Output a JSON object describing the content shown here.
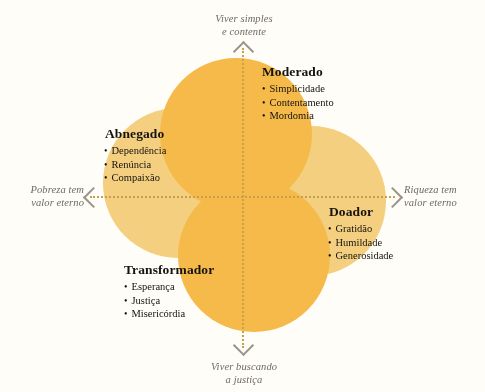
{
  "diagram": {
    "title_alt": "Diagrama de quadrantes sobre riqueza e pobreza",
    "colors": {
      "background": "#fefdf7",
      "circle_dark": "#f5ba4a",
      "circle_light": "#f9dd9a",
      "axis": "#c9a04a",
      "axis_label_text": "#6e6a61",
      "body_text": "#16130f"
    }
  },
  "axes": {
    "top": {
      "line1": "Viver simples",
      "line2": "e contente",
      "arrow": "arrow-up-icon"
    },
    "bottom": {
      "line1": "Viver buscando",
      "line2": "a justiça",
      "arrow": "arrow-down-icon"
    },
    "left": {
      "line1": "Pobreza tem",
      "line2": "valor eterno",
      "arrow": "arrow-left-icon"
    },
    "right": {
      "line1": "Riqueza tem",
      "line2": "valor eterno",
      "arrow": "arrow-right-icon"
    }
  },
  "quadrants": [
    {
      "id": "moderado",
      "title": "Moderado",
      "items": [
        "Simplicidade",
        "Contentamento",
        "Mordomia"
      ]
    },
    {
      "id": "abnegado",
      "title": "Abnegado",
      "items": [
        "Dependência",
        "Renúncia",
        "Compaixão"
      ]
    },
    {
      "id": "doador",
      "title": "Doador",
      "items": [
        "Gratidão",
        "Humildade",
        "Generosidade"
      ]
    },
    {
      "id": "transformador",
      "title": "Transformador",
      "items": [
        "Esperança",
        "Justiça",
        "Misericórdia"
      ]
    }
  ]
}
